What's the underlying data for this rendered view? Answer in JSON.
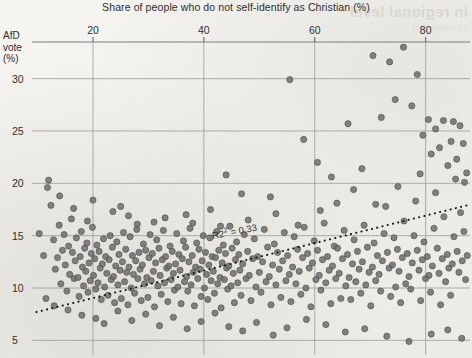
{
  "figure": {
    "bleed_through_text": "in regional level",
    "bleed_through_sub": "Christian (%)"
  },
  "chart_data": {
    "type": "scatter",
    "title": "",
    "xlabel": "Share of people who do not self-identify as Christian (%)",
    "ylabel": "AfD vote (%)",
    "ylabel_lines": [
      "AfD",
      "vote",
      "(%)"
    ],
    "xlim": [
      9,
      88
    ],
    "ylim": [
      3.6,
      33.5
    ],
    "xticks": [
      20,
      40,
      60,
      80
    ],
    "yticks": [
      5,
      10,
      15,
      20,
      25,
      30
    ],
    "grid": true,
    "legend": null,
    "annotations": [
      {
        "text": "R² = 0.33",
        "label": "R2",
        "superscript": "2",
        "rest": " = 0.33",
        "value": 0.33
      }
    ],
    "trendline": {
      "type": "linear-dotted",
      "x_start": 9.8,
      "y_start": 7.7,
      "x_end": 87.5,
      "y_end": 17.9,
      "r_squared": 0.33
    },
    "marker": {
      "color": "#6d6d6d",
      "edge": "#4a4a4a",
      "size": 6.2,
      "alpha": 0.85
    },
    "point_count": 332,
    "points": [
      [
        10.3,
        15.2
      ],
      [
        11.1,
        13.1
      ],
      [
        11.8,
        19.6
      ],
      [
        12.4,
        17.9
      ],
      [
        12.9,
        14.6
      ],
      [
        13.2,
        11.8
      ],
      [
        13.6,
        12.9
      ],
      [
        13.9,
        16.0
      ],
      [
        14.2,
        10.4
      ],
      [
        14.5,
        13.6
      ],
      [
        14.8,
        15.1
      ],
      [
        15.0,
        12.2
      ],
      [
        15.3,
        9.7
      ],
      [
        15.6,
        14.0
      ],
      [
        15.8,
        11.3
      ],
      [
        16.1,
        16.6
      ],
      [
        16.3,
        13.4
      ],
      [
        16.6,
        10.9
      ],
      [
        16.8,
        12.6
      ],
      [
        17.0,
        14.8
      ],
      [
        17.3,
        11.0
      ],
      [
        17.5,
        9.2
      ],
      [
        17.7,
        13.0
      ],
      [
        17.9,
        15.4
      ],
      [
        18.1,
        12.0
      ],
      [
        18.3,
        10.2
      ],
      [
        18.5,
        13.8
      ],
      [
        18.7,
        11.6
      ],
      [
        18.9,
        14.3
      ],
      [
        19.1,
        9.6
      ],
      [
        19.3,
        12.4
      ],
      [
        19.5,
        10.7
      ],
      [
        19.7,
        13.3
      ],
      [
        19.9,
        15.8
      ],
      [
        20.1,
        11.2
      ],
      [
        20.3,
        12.8
      ],
      [
        20.5,
        9.9
      ],
      [
        20.7,
        14.1
      ],
      [
        20.9,
        10.5
      ],
      [
        21.1,
        13.5
      ],
      [
        21.3,
        11.9
      ],
      [
        21.5,
        8.9
      ],
      [
        21.7,
        12.3
      ],
      [
        21.9,
        14.7
      ],
      [
        22.1,
        10.1
      ],
      [
        22.3,
        13.0
      ],
      [
        22.5,
        11.4
      ],
      [
        22.7,
        9.3
      ],
      [
        22.9,
        12.7
      ],
      [
        23.1,
        15.0
      ],
      [
        23.3,
        10.8
      ],
      [
        23.5,
        13.9
      ],
      [
        23.7,
        11.1
      ],
      [
        23.9,
        8.6
      ],
      [
        24.1,
        12.1
      ],
      [
        24.3,
        14.4
      ],
      [
        24.5,
        10.3
      ],
      [
        24.7,
        13.2
      ],
      [
        24.9,
        11.7
      ],
      [
        25.1,
        9.0
      ],
      [
        25.3,
        12.5
      ],
      [
        25.5,
        15.3
      ],
      [
        25.7,
        10.6
      ],
      [
        25.9,
        13.7
      ],
      [
        26.1,
        11.5
      ],
      [
        26.3,
        8.4
      ],
      [
        26.5,
        12.0
      ],
      [
        26.7,
        14.9
      ],
      [
        26.9,
        10.0
      ],
      [
        27.1,
        13.1
      ],
      [
        27.3,
        11.3
      ],
      [
        27.5,
        9.5
      ],
      [
        27.7,
        12.6
      ],
      [
        27.9,
        15.6
      ],
      [
        28.1,
        10.9
      ],
      [
        28.3,
        13.4
      ],
      [
        28.5,
        11.8
      ],
      [
        28.7,
        8.8
      ],
      [
        28.9,
        12.2
      ],
      [
        29.1,
        14.2
      ],
      [
        29.3,
        10.4
      ],
      [
        29.5,
        13.6
      ],
      [
        29.7,
        11.0
      ],
      [
        29.9,
        9.1
      ],
      [
        30.1,
        12.9
      ],
      [
        30.3,
        15.1
      ],
      [
        30.5,
        10.7
      ],
      [
        30.7,
        13.3
      ],
      [
        30.9,
        11.6
      ],
      [
        31.1,
        8.2
      ],
      [
        31.3,
        12.4
      ],
      [
        31.5,
        14.6
      ],
      [
        31.7,
        10.2
      ],
      [
        31.9,
        13.8
      ],
      [
        32.1,
        11.2
      ],
      [
        32.3,
        9.4
      ],
      [
        32.5,
        12.7
      ],
      [
        32.7,
        15.5
      ],
      [
        32.9,
        10.5
      ],
      [
        33.1,
        13.0
      ],
      [
        33.3,
        11.9
      ],
      [
        33.5,
        8.7
      ],
      [
        33.7,
        12.1
      ],
      [
        33.9,
        14.0
      ],
      [
        34.1,
        10.8
      ],
      [
        34.3,
        13.5
      ],
      [
        34.5,
        11.4
      ],
      [
        34.7,
        9.8
      ],
      [
        34.9,
        12.3
      ],
      [
        35.1,
        15.2
      ],
      [
        35.3,
        10.1
      ],
      [
        35.5,
        13.2
      ],
      [
        35.7,
        11.7
      ],
      [
        35.9,
        8.5
      ],
      [
        36.1,
        12.8
      ],
      [
        36.3,
        14.5
      ],
      [
        36.5,
        10.6
      ],
      [
        36.7,
        13.9
      ],
      [
        36.9,
        11.1
      ],
      [
        37.1,
        9.7
      ],
      [
        37.3,
        12.5
      ],
      [
        37.5,
        15.7
      ],
      [
        37.7,
        10.3
      ],
      [
        37.9,
        13.1
      ],
      [
        38.1,
        11.5
      ],
      [
        38.3,
        8.3
      ],
      [
        38.5,
        12.0
      ],
      [
        38.7,
        14.3
      ],
      [
        38.9,
        10.9
      ],
      [
        39.1,
        13.7
      ],
      [
        39.3,
        11.8
      ],
      [
        39.5,
        9.2
      ],
      [
        39.7,
        12.6
      ],
      [
        39.9,
        15.0
      ],
      [
        40.1,
        10.0
      ],
      [
        40.3,
        13.4
      ],
      [
        40.5,
        11.3
      ],
      [
        40.7,
        8.9
      ],
      [
        40.9,
        12.2
      ],
      [
        41.1,
        14.8
      ],
      [
        41.3,
        10.7
      ],
      [
        41.5,
        13.0
      ],
      [
        41.7,
        11.6
      ],
      [
        41.9,
        9.5
      ],
      [
        42.1,
        12.9
      ],
      [
        42.3,
        15.4
      ],
      [
        42.5,
        10.4
      ],
      [
        42.7,
        13.6
      ],
      [
        42.9,
        11.0
      ],
      [
        43.1,
        8.1
      ],
      [
        43.3,
        12.4
      ],
      [
        43.5,
        14.1
      ],
      [
        43.7,
        10.8
      ],
      [
        43.9,
        13.3
      ],
      [
        44.1,
        11.9
      ],
      [
        44.3,
        9.9
      ],
      [
        44.5,
        12.1
      ],
      [
        44.7,
        15.9
      ],
      [
        44.9,
        10.2
      ],
      [
        45.1,
        13.8
      ],
      [
        45.3,
        11.4
      ],
      [
        45.5,
        8.6
      ],
      [
        45.7,
        12.7
      ],
      [
        45.9,
        14.4
      ],
      [
        46.1,
        10.5
      ],
      [
        46.3,
        13.2
      ],
      [
        46.5,
        11.7
      ],
      [
        46.7,
        9.3
      ],
      [
        47.0,
        12.3
      ],
      [
        47.3,
        15.1
      ],
      [
        47.6,
        10.9
      ],
      [
        47.9,
        13.5
      ],
      [
        48.2,
        11.2
      ],
      [
        48.5,
        8.8
      ],
      [
        48.8,
        12.8
      ],
      [
        49.1,
        14.7
      ],
      [
        49.4,
        10.1
      ],
      [
        49.7,
        13.0
      ],
      [
        50.0,
        11.5
      ],
      [
        50.3,
        9.6
      ],
      [
        50.6,
        12.5
      ],
      [
        50.9,
        15.6
      ],
      [
        51.2,
        10.6
      ],
      [
        51.5,
        13.9
      ],
      [
        51.8,
        11.1
      ],
      [
        52.1,
        8.4
      ],
      [
        52.4,
        12.2
      ],
      [
        52.7,
        14.2
      ],
      [
        53.0,
        10.3
      ],
      [
        53.3,
        13.4
      ],
      [
        53.6,
        11.8
      ],
      [
        53.9,
        9.1
      ],
      [
        54.2,
        12.6
      ],
      [
        54.5,
        15.3
      ],
      [
        54.8,
        10.7
      ],
      [
        55.1,
        13.1
      ],
      [
        55.4,
        11.3
      ],
      [
        55.7,
        8.7
      ],
      [
        56.0,
        12.0
      ],
      [
        56.3,
        14.9
      ],
      [
        56.6,
        10.4
      ],
      [
        56.9,
        13.7
      ],
      [
        57.2,
        11.6
      ],
      [
        57.5,
        9.4
      ],
      [
        57.8,
        12.9
      ],
      [
        58.1,
        15.8
      ],
      [
        58.4,
        10.0
      ],
      [
        58.7,
        13.3
      ],
      [
        59.0,
        11.9
      ],
      [
        59.3,
        8.2
      ],
      [
        59.6,
        12.4
      ],
      [
        59.9,
        14.5
      ],
      [
        60.2,
        10.8
      ],
      [
        60.5,
        13.6
      ],
      [
        60.8,
        11.2
      ],
      [
        61.1,
        9.8
      ],
      [
        61.4,
        12.7
      ],
      [
        61.7,
        16.2
      ],
      [
        62.0,
        10.5
      ],
      [
        62.3,
        13.0
      ],
      [
        62.6,
        11.7
      ],
      [
        62.9,
        8.5
      ],
      [
        63.2,
        12.1
      ],
      [
        63.5,
        14.0
      ],
      [
        63.8,
        10.9
      ],
      [
        64.1,
        13.8
      ],
      [
        64.4,
        11.4
      ],
      [
        64.7,
        9.0
      ],
      [
        65.0,
        12.8
      ],
      [
        65.3,
        15.5
      ],
      [
        65.6,
        10.2
      ],
      [
        65.9,
        13.2
      ],
      [
        66.2,
        11.0
      ],
      [
        66.5,
        8.9
      ],
      [
        66.8,
        12.3
      ],
      [
        67.1,
        14.6
      ],
      [
        67.4,
        10.6
      ],
      [
        67.7,
        13.5
      ],
      [
        68.0,
        11.8
      ],
      [
        68.3,
        9.5
      ],
      [
        68.6,
        12.5
      ],
      [
        68.9,
        16.0
      ],
      [
        69.2,
        10.3
      ],
      [
        69.5,
        13.9
      ],
      [
        69.8,
        11.5
      ],
      [
        70.1,
        8.3
      ],
      [
        70.4,
        12.0
      ],
      [
        70.7,
        14.3
      ],
      [
        71.0,
        10.7
      ],
      [
        71.3,
        13.1
      ],
      [
        71.6,
        11.3
      ],
      [
        71.9,
        9.7
      ],
      [
        72.2,
        12.6
      ],
      [
        72.5,
        15.2
      ],
      [
        72.8,
        17.8
      ],
      [
        73.1,
        13.4
      ],
      [
        73.4,
        11.9
      ],
      [
        73.7,
        9.2
      ],
      [
        74.0,
        12.2
      ],
      [
        74.3,
        14.8
      ],
      [
        74.6,
        10.1
      ],
      [
        74.9,
        13.7
      ],
      [
        75.2,
        11.6
      ],
      [
        75.5,
        8.6
      ],
      [
        75.8,
        12.9
      ],
      [
        76.1,
        16.4
      ],
      [
        76.4,
        10.4
      ],
      [
        76.7,
        13.3
      ],
      [
        77.0,
        11.1
      ],
      [
        77.3,
        9.9
      ],
      [
        77.6,
        12.4
      ],
      [
        77.9,
        15.0
      ],
      [
        78.2,
        18.3
      ],
      [
        78.5,
        13.6
      ],
      [
        78.8,
        11.7
      ],
      [
        79.1,
        8.8
      ],
      [
        79.4,
        12.7
      ],
      [
        79.7,
        14.4
      ],
      [
        80.0,
        10.9
      ],
      [
        80.3,
        13.0
      ],
      [
        80.6,
        11.2
      ],
      [
        80.9,
        9.6
      ],
      [
        81.2,
        12.1
      ],
      [
        81.5,
        15.7
      ],
      [
        81.8,
        19.1
      ],
      [
        82.1,
        13.8
      ],
      [
        82.4,
        11.4
      ],
      [
        82.7,
        8.4
      ],
      [
        83.0,
        12.8
      ],
      [
        83.3,
        16.8
      ],
      [
        83.6,
        10.6
      ],
      [
        83.9,
        13.2
      ],
      [
        84.2,
        11.9
      ],
      [
        84.5,
        9.3
      ],
      [
        84.8,
        12.3
      ],
      [
        85.1,
        14.9
      ],
      [
        85.4,
        20.4
      ],
      [
        85.7,
        13.5
      ],
      [
        86.0,
        11.5
      ],
      [
        86.3,
        17.2
      ],
      [
        86.6,
        12.6
      ],
      [
        86.9,
        15.4
      ],
      [
        87.2,
        10.8
      ],
      [
        87.5,
        13.1
      ],
      [
        20.0,
        18.4
      ],
      [
        23.6,
        17.3
      ],
      [
        26.4,
        16.9
      ],
      [
        31.0,
        16.3
      ],
      [
        36.8,
        17.0
      ],
      [
        41.2,
        17.5
      ],
      [
        44.0,
        20.8
      ],
      [
        46.8,
        19.0
      ],
      [
        52.0,
        18.7
      ],
      [
        55.5,
        29.9
      ],
      [
        58.0,
        24.2
      ],
      [
        60.5,
        22.0
      ],
      [
        63.0,
        20.6
      ],
      [
        66.0,
        25.7
      ],
      [
        68.5,
        21.4
      ],
      [
        70.5,
        32.2
      ],
      [
        72.0,
        26.3
      ],
      [
        73.5,
        31.6
      ],
      [
        74.5,
        28.0
      ],
      [
        76.0,
        33.0
      ],
      [
        77.5,
        27.4
      ],
      [
        78.5,
        30.4
      ],
      [
        79.5,
        24.6
      ],
      [
        80.5,
        26.1
      ],
      [
        81.0,
        22.8
      ],
      [
        81.8,
        25.2
      ],
      [
        82.5,
        23.4
      ],
      [
        83.2,
        26.0
      ],
      [
        84.0,
        21.7
      ],
      [
        84.6,
        24.0
      ],
      [
        85.0,
        25.9
      ],
      [
        85.6,
        22.3
      ],
      [
        86.2,
        25.5
      ],
      [
        86.8,
        23.8
      ],
      [
        87.0,
        20.1
      ],
      [
        87.4,
        21.0
      ],
      [
        11.5,
        9.0
      ],
      [
        13.0,
        8.3
      ],
      [
        15.5,
        7.9
      ],
      [
        18.0,
        7.4
      ],
      [
        20.5,
        7.1
      ],
      [
        22.0,
        6.6
      ],
      [
        24.5,
        7.8
      ],
      [
        27.0,
        6.9
      ],
      [
        29.5,
        7.5
      ],
      [
        32.0,
        6.4
      ],
      [
        34.5,
        7.2
      ],
      [
        37.0,
        6.1
      ],
      [
        39.5,
        6.8
      ],
      [
        42.0,
        7.6
      ],
      [
        44.5,
        6.3
      ],
      [
        47.0,
        5.9
      ],
      [
        49.5,
        6.7
      ],
      [
        52.5,
        5.5
      ],
      [
        55.0,
        6.2
      ],
      [
        58.5,
        7.0
      ],
      [
        62.0,
        6.5
      ],
      [
        65.5,
        5.8
      ],
      [
        69.0,
        6.1
      ],
      [
        73.0,
        5.4
      ],
      [
        77.0,
        4.9
      ],
      [
        81.0,
        5.6
      ],
      [
        84.0,
        6.0
      ],
      [
        86.5,
        5.2
      ],
      [
        12.0,
        20.3
      ],
      [
        14.0,
        18.8
      ],
      [
        16.5,
        17.6
      ],
      [
        19.0,
        16.4
      ],
      [
        25.0,
        17.8
      ],
      [
        28.0,
        16.1
      ],
      [
        33.0,
        16.7
      ],
      [
        38.0,
        16.2
      ],
      [
        43.0,
        15.9
      ],
      [
        48.0,
        16.5
      ],
      [
        53.0,
        17.1
      ],
      [
        57.0,
        16.0
      ],
      [
        61.0,
        17.4
      ],
      [
        64.0,
        18.1
      ],
      [
        67.0,
        19.4
      ],
      [
        71.0,
        18.0
      ],
      [
        75.0,
        19.7
      ],
      [
        79.0,
        20.9
      ]
    ]
  }
}
